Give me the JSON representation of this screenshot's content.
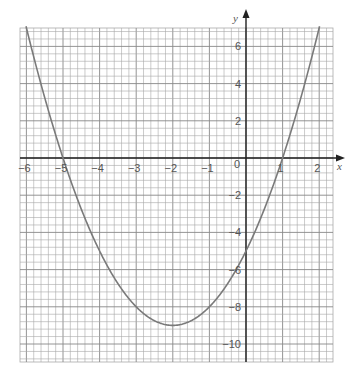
{
  "chart_data": {
    "type": "line",
    "title": "",
    "xlabel": "x",
    "ylabel": "y",
    "xlim": [
      -6.2,
      2.4
    ],
    "ylim": [
      -11,
      7
    ],
    "grid": true,
    "x_ticks": [
      -6,
      -5,
      -4,
      -3,
      -2,
      -1,
      0,
      1,
      2
    ],
    "x_tick_labels": [
      "-6",
      "-5",
      "-4",
      "-3",
      "-2",
      "-1",
      "0",
      "1",
      "2"
    ],
    "y_ticks": [
      -10,
      -8,
      -6,
      -4,
      -2,
      2,
      4,
      6
    ],
    "y_tick_labels": [
      "-10",
      "-8",
      "-6",
      "-4",
      "-2",
      "2",
      "4",
      "6"
    ],
    "series": [
      {
        "name": "y = x^2 + 4x - 5",
        "x": [
          -6,
          -5.5,
          -5,
          -4.5,
          -4,
          -3.5,
          -3,
          -2.5,
          -2,
          -1.5,
          -1,
          -0.5,
          0,
          0.5,
          1,
          1.5,
          2
        ],
        "y": [
          7,
          3.25,
          0,
          -2.75,
          -5,
          -6.75,
          -8,
          -8.75,
          -9,
          -8.75,
          -8,
          -6.75,
          -5,
          -2.75,
          0,
          3.25,
          7
        ]
      }
    ],
    "annotations": {
      "roots": [
        -5,
        1
      ],
      "vertex": [
        -2,
        -9
      ],
      "y_intercept": -5
    },
    "colors": {
      "curve": "#7a7a7a",
      "grid": "#9a9a9a",
      "axes": "#222222"
    }
  }
}
